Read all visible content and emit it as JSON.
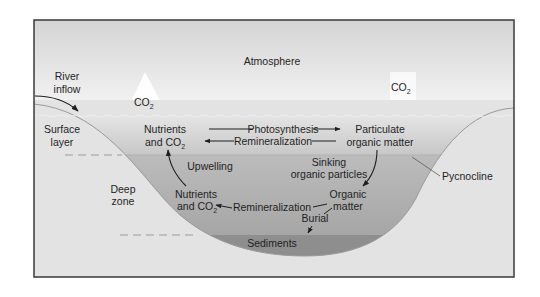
{
  "diagram": {
    "colors": {
      "frame_border": "#3a3a3a",
      "atmosphere_top": "#d6d6d6",
      "atmosphere_bottom": "#f7f7f7",
      "land": "#e3e3e3",
      "surface_water_top": "#e2e2e2",
      "surface_water_bottom": "#c9c9c9",
      "deep_water_top": "#bdbdbd",
      "deep_water_bottom": "#a9a9a9",
      "sediment": "#8f8f8f",
      "text": "#1f1f1f"
    },
    "labels": {
      "atmosphere": "Atmosphere",
      "river_inflow_line1": "River",
      "river_inflow_line2": "inflow",
      "co2_left": "CO",
      "co2_left_sub": "2",
      "co2_right": "CO",
      "co2_right_sub": "2",
      "surface_layer_line1": "Surface",
      "surface_layer_line2": "layer",
      "deep_zone_line1": "Deep",
      "deep_zone_line2": "zone",
      "pycnocline": "Pycnocline",
      "nutrients_surface_line1": "Nutrients",
      "nutrients_surface_line2": "and CO",
      "nutrients_surface_sub": "2",
      "photosynthesis": "Photosynthesis",
      "remineralization_surface": "Remineralization",
      "particulate_line1": "Particulate",
      "particulate_line2": "organic matter",
      "upwelling": "Upwelling",
      "sinking_line1": "Sinking",
      "sinking_line2": "organic particles",
      "nutrients_deep_line1": "Nutrients",
      "nutrients_deep_line2": "and CO",
      "nutrients_deep_sub": "2",
      "remineralization_deep": "Remineralization",
      "organic_matter_line1": "Organic",
      "organic_matter_line2": "matter",
      "burial": "Burial",
      "sediments": "Sediments"
    },
    "flows": [
      {
        "from": "Nutrients and CO2 (surface)",
        "to": "Particulate organic matter",
        "process": "Photosynthesis"
      },
      {
        "from": "Particulate organic matter",
        "to": "Nutrients and CO2 (surface)",
        "process": "Remineralization"
      },
      {
        "from": "Particulate organic matter",
        "to": "Organic matter (deep)",
        "process": "Sinking organic particles"
      },
      {
        "from": "Organic matter (deep)",
        "to": "Nutrients and CO2 (deep)",
        "process": "Remineralization"
      },
      {
        "from": "Organic matter (deep)",
        "to": "Sediments",
        "process": "Burial"
      },
      {
        "from": "Nutrients and CO2 (deep)",
        "to": "Nutrients and CO2 (surface)",
        "process": "Upwelling"
      },
      {
        "from": "River inflow",
        "to": "Surface layer",
        "process": "River inflow"
      }
    ]
  }
}
